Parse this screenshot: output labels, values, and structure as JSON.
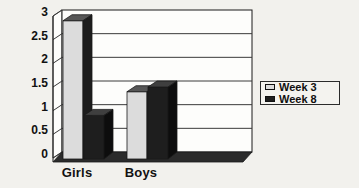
{
  "chart_data": {
    "type": "bar",
    "style": "3d-clustered-column",
    "title": "",
    "xlabel": "",
    "ylabel": "",
    "categories": [
      "Girls",
      "Boys"
    ],
    "series": [
      {
        "name": "Week 3",
        "values": [
          2.9,
          1.4
        ],
        "color_front": "#dcdcdc",
        "color_top": "#565656",
        "color_side": "#1c1c1c"
      },
      {
        "name": "Week 8",
        "values": [
          0.9,
          1.5
        ],
        "color_front": "#1e1e1e",
        "color_top": "#3f3f3f",
        "color_side": "#0d0d0d"
      }
    ],
    "ylim": [
      0,
      3
    ],
    "ytick_step": 0.5,
    "ytick_labels": [
      "0",
      "0.5",
      "1",
      "1.5",
      "2",
      "2.5",
      "3"
    ],
    "grid": true,
    "legend": {
      "position": "right"
    },
    "colors": {
      "background": "#f2f1ed",
      "wall": "#fdfdfb",
      "floor": "#2b2b2b",
      "gridline": "#3a3a3a",
      "outline": "#1a1a1a",
      "text": "#111111"
    }
  }
}
